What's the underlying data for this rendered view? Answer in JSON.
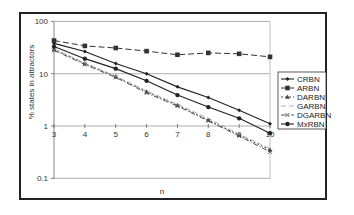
{
  "chart_data": {
    "type": "line",
    "title": "",
    "xlabel": "n",
    "ylabel": "% states in attractors",
    "yscale": "log",
    "ylim": [
      0.1,
      100
    ],
    "xlim": [
      3,
      10
    ],
    "x": [
      3,
      4,
      5,
      6,
      7,
      8,
      9,
      10
    ],
    "x_ticks": [
      "3",
      "4",
      "5",
      "6",
      "7",
      "8",
      "9",
      "10"
    ],
    "y_ticks": [
      "0.1",
      "1",
      "10",
      "100"
    ],
    "grid": "horizontal major gridlines",
    "legend_position": "right",
    "series": [
      {
        "name": "CRBN",
        "marker": "small-diamond",
        "line": "solid",
        "values": [
          38,
          26.5,
          15.6,
          10,
          5.6,
          3.5,
          2.0,
          1.1
        ]
      },
      {
        "name": "ARBN",
        "marker": "square",
        "line": "dashed",
        "values": [
          43,
          34,
          31,
          27,
          23,
          25,
          24,
          21
        ]
      },
      {
        "name": "DARBN",
        "marker": "triangle",
        "line": "dotted",
        "values": [
          29,
          15.6,
          8.8,
          4.5,
          2.5,
          1.3,
          0.67,
          0.35
        ]
      },
      {
        "name": "GARBN",
        "marker": "none",
        "line": "dash-light",
        "values": [
          30,
          16,
          9.0,
          4.7,
          2.6,
          1.4,
          0.7,
          0.37
        ]
      },
      {
        "name": "DGARBN",
        "marker": "x",
        "line": "dash-dot",
        "values": [
          28,
          15,
          8.5,
          4.3,
          2.4,
          1.25,
          0.64,
          0.32
        ]
      },
      {
        "name": "MxRBN",
        "marker": "circle",
        "line": "solid",
        "values": [
          33,
          19.4,
          12.5,
          7.3,
          3.9,
          2.3,
          1.4,
          0.73
        ]
      }
    ]
  }
}
